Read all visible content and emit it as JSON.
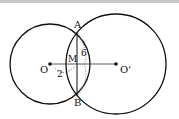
{
  "diagram": {
    "title": "",
    "colors": {
      "stroke": "#111111",
      "background": "#ffffff",
      "topbar": "#c8c8c8"
    },
    "circles": [
      {
        "id": "circle-O",
        "center": "O",
        "cx": 50,
        "cy": 64,
        "r": 40
      },
      {
        "id": "circle-O-prime",
        "center": "O'",
        "cx": 116,
        "cy": 64,
        "r": 50
      }
    ],
    "points": {
      "O": {
        "label": "O",
        "x": 50,
        "y": 64
      },
      "O_prime": {
        "label": "O'",
        "x": 116,
        "y": 64
      },
      "A": {
        "label": "A",
        "x": 77,
        "y": 32
      },
      "B": {
        "label": "B",
        "x": 77,
        "y": 96
      },
      "M": {
        "label": "M",
        "x": 77,
        "y": 64
      }
    },
    "segments": [
      {
        "from": "O",
        "to": "O'",
        "style": "solid"
      },
      {
        "from": "A",
        "to": "B",
        "style": "solid"
      }
    ],
    "annotations": {
      "AM_length": "6",
      "OM_length": "2"
    }
  }
}
